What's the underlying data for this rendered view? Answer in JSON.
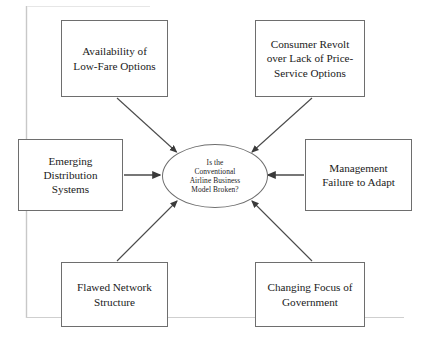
{
  "diagram": {
    "type": "cause-and-effect-diagram",
    "background_color": "#ffffff",
    "stroke_color": "#6e6e6e",
    "text_color": "#1a1a1a",
    "center": {
      "shape": "ellipse",
      "text": "Is the\nConventional\nAirline Business\nModel Broken?"
    },
    "causes": [
      {
        "id": "availability",
        "position": "top-left",
        "text": "Availability of\nLow-Fare Options",
        "arrow": "diagonal-down-right"
      },
      {
        "id": "consumer-revolt",
        "position": "top-right",
        "text": "Consumer Revolt\nover Lack of Price-\nService Options",
        "arrow": "diagonal-down-left"
      },
      {
        "id": "emerging-distribution",
        "position": "middle-left",
        "text": "Emerging\nDistribution\nSystems",
        "arrow": "horizontal-right"
      },
      {
        "id": "management-failure",
        "position": "middle-right",
        "text": "Management\nFailure to Adapt",
        "arrow": "horizontal-left"
      },
      {
        "id": "flawed-network",
        "position": "bottom-left",
        "text": "Flawed Network\nStructure",
        "arrow": "diagonal-up-right"
      },
      {
        "id": "changing-focus",
        "position": "bottom-right",
        "text": "Changing Focus of\nGovernment",
        "arrow": "diagonal-up-left"
      }
    ]
  }
}
